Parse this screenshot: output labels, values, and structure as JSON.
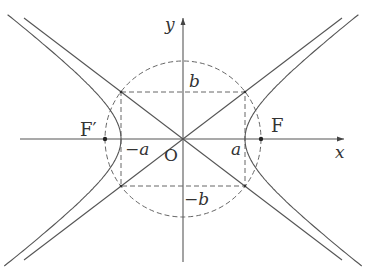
{
  "diagram": {
    "colors": {
      "stroke": "#555555",
      "dashed": "#666666",
      "text": "#333333",
      "background": "#ffffff"
    },
    "axes": {
      "x_label": "x",
      "y_label": "y",
      "origin_label": "O"
    },
    "labels": {
      "a_pos": "a",
      "a_neg": "−a",
      "b_pos": "b",
      "b_neg": "−b",
      "focus_right": "F",
      "focus_left": "F′"
    },
    "elements": [
      "hyperbola right branch",
      "hyperbola left branch",
      "asymptote y = (b/a)x",
      "asymptote y = -(b/a)x",
      "dashed circle radius c",
      "dashed rectangle 2a × 2b",
      "focus points F and F′"
    ]
  }
}
